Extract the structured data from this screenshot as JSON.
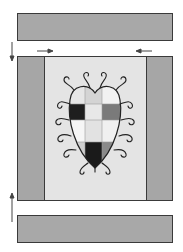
{
  "diagram": {
    "type": "quilt-block-assembly",
    "colors": {
      "background": "#ffffff",
      "band_fill": "#a8a8a8",
      "side_strip_fill": "#a6a6a6",
      "center_fill": "#e4e4e4",
      "outline": "#333333",
      "swirl": "#222222",
      "arrow": "#444444"
    },
    "top_band": {
      "label": ""
    },
    "bottom_band": {
      "label": ""
    },
    "middle_panel": {
      "left_strip": "",
      "right_strip": "",
      "center": {
        "motif": "heart-with-checkered-grid-and-swirls",
        "grid": [
          [
            "#e6e6e6",
            "#d4d4d4",
            "#f2f2f2"
          ],
          [
            "#1e1e1e",
            "#e8e8e8",
            "#7a7a7a"
          ],
          [
            "#f6f6f6",
            "#e2e2e2",
            "#f0f0f0"
          ],
          [
            "#cfcfcf",
            "#1a1a1a",
            "#8a8a8a"
          ]
        ]
      }
    },
    "arrows": [
      {
        "name": "down-arrow-left",
        "direction": "down"
      },
      {
        "name": "right-arrow-top-left",
        "direction": "right"
      },
      {
        "name": "left-arrow-top-right",
        "direction": "left"
      },
      {
        "name": "up-arrow-bottom-left",
        "direction": "up"
      }
    ]
  }
}
